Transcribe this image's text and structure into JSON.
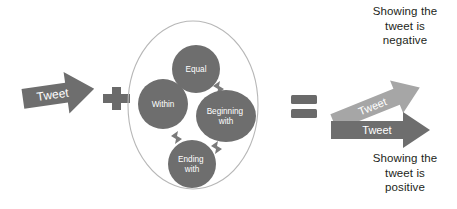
{
  "diagram": {
    "input": {
      "arrow_label": "Tweet"
    },
    "operator_plus": "+",
    "operator_equals": "=",
    "matching_group": {
      "nodes": [
        {
          "id": "equal",
          "label": "Equal"
        },
        {
          "id": "within",
          "label": "Within"
        },
        {
          "id": "beginning-with",
          "label": "Beginning\nwith"
        },
        {
          "id": "ending-with",
          "label": "Ending\nwith"
        }
      ]
    },
    "outputs": [
      {
        "id": "negative",
        "arrow_label": "Tweet",
        "caption": "Showing the\ntweet is\nnegative"
      },
      {
        "id": "positive",
        "arrow_label": "Tweet",
        "caption": "Showing the\ntweet is\npositive"
      }
    ]
  },
  "colors": {
    "arrow_dark": "#6e6e6e",
    "arrow_light": "#a6a6a6",
    "node_fill": "#6e6e6e",
    "outer_circle_stroke": "#b7b7b7",
    "operator": "#6a6a6a",
    "text": "#231f20",
    "background": "#ffffff"
  }
}
